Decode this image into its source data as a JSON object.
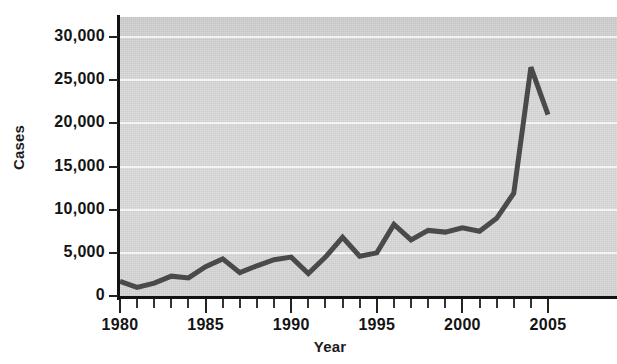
{
  "chart_data": {
    "type": "line",
    "title": "",
    "xlabel": "Year",
    "ylabel": "Cases",
    "xlim": [
      1980,
      2005.6
    ],
    "ylim": [
      0,
      32000
    ],
    "grid": true,
    "legend": "none",
    "y_ticks": [
      0,
      5000,
      10000,
      15000,
      20000,
      25000,
      30000
    ],
    "y_tick_labels": [
      "0",
      "5,000",
      "10,000",
      "15,000",
      "20,000",
      "25,000",
      "30,000"
    ],
    "x_ticks": [
      1980,
      1985,
      1990,
      1995,
      2000,
      2005
    ],
    "x_tick_labels": [
      "1980",
      "1985",
      "1990",
      "1995",
      "2000",
      "2005"
    ],
    "x_minor_tick_interval": 1,
    "x": [
      1980,
      1981,
      1982,
      1983,
      1984,
      1985,
      1986,
      1987,
      1988,
      1989,
      1990,
      1991,
      1992,
      1993,
      1994,
      1995,
      1996,
      1997,
      1998,
      1999,
      2000,
      2001,
      2002,
      2003,
      2004,
      2005
    ],
    "values": [
      1700,
      1000,
      1500,
      2300,
      2100,
      3400,
      4300,
      2700,
      3500,
      4200,
      4500,
      2600,
      4500,
      6800,
      4600,
      5000,
      8300,
      6500,
      7600,
      7400,
      7900,
      7500,
      9000,
      11900,
      26500,
      21000
    ],
    "series": [
      {
        "name": "Cases",
        "color": "#4a4a4a",
        "values": [
          1700,
          1000,
          1500,
          2300,
          2100,
          3400,
          4300,
          2700,
          3500,
          4200,
          4500,
          2600,
          4500,
          6800,
          4600,
          5000,
          8300,
          6500,
          7600,
          7400,
          7900,
          7500,
          9000,
          11900,
          26500,
          21000
        ]
      }
    ]
  },
  "style": {
    "plot_background": "#d8d8d8",
    "gridline_color": "#f4f4f4",
    "axis_color": "#111111",
    "line_color": "#4a4a4a",
    "text_color": "#141414"
  }
}
